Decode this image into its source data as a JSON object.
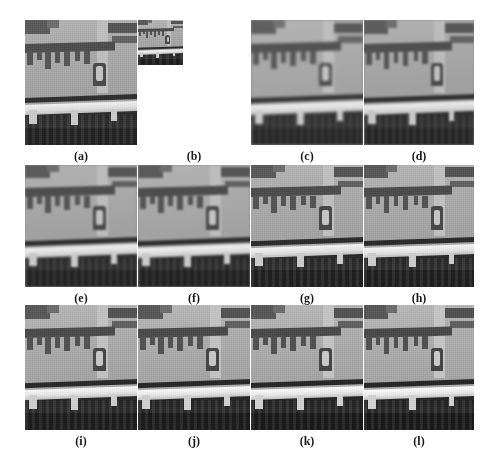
{
  "figure": {
    "type": "image-comparison-grid",
    "background_color": "#ffffff",
    "rows": 3,
    "columns": 4,
    "total_panels": 12,
    "scene_description": "Grayscale aerial/satellite view of a building facade with eave shadows, a dark rail line, a bright horizontal road or bridge deck with pale piers, and dark ground/water below",
    "colors": {
      "wall_light_gray": "#a6a6a6",
      "shadow_dark_gray": "#4e4e4e",
      "road_bright": "#f0f0f0",
      "ground_dark": "#2b2b2b",
      "caption_text": "#1a1a1a",
      "page_background": "#ffffff"
    },
    "panels": [
      {
        "id": "a",
        "label": "(a)",
        "variant": "v-gt",
        "size": "large",
        "note": "reference image"
      },
      {
        "id": "b",
        "label": "(b)",
        "variant": "v-lr",
        "size": "small",
        "note": "low-resolution input"
      },
      {
        "id": "c",
        "label": "(c)",
        "variant": "v-blur1",
        "size": "large",
        "note": "result"
      },
      {
        "id": "d",
        "label": "(d)",
        "variant": "v-blur2",
        "size": "large",
        "note": "result"
      },
      {
        "id": "e",
        "label": "(e)",
        "variant": "v-blur3",
        "size": "large",
        "note": "result"
      },
      {
        "id": "f",
        "label": "(f)",
        "variant": "v-blur4",
        "size": "large",
        "note": "result"
      },
      {
        "id": "g",
        "label": "(g)",
        "variant": "v-blur5",
        "size": "large",
        "note": "result"
      },
      {
        "id": "h",
        "label": "(h)",
        "variant": "v-blur6",
        "size": "large",
        "note": "result"
      },
      {
        "id": "i",
        "label": "(i)",
        "variant": "v-sharp1",
        "size": "large",
        "note": "result"
      },
      {
        "id": "j",
        "label": "(j)",
        "variant": "v-sharp2",
        "size": "large",
        "note": "result"
      },
      {
        "id": "k",
        "label": "(k)",
        "variant": "v-sharp3",
        "size": "large",
        "note": "result"
      },
      {
        "id": "l",
        "label": "(l)",
        "variant": "v-sharp4",
        "size": "large",
        "note": "result"
      }
    ]
  }
}
